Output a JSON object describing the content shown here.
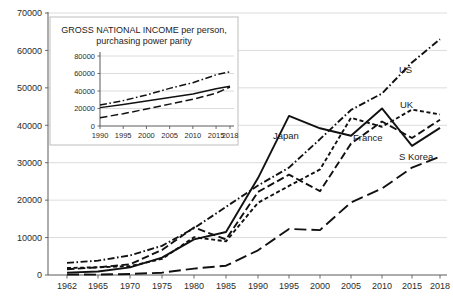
{
  "chart_data": {
    "type": "line",
    "title": "",
    "xlabel": "",
    "ylabel": "",
    "grid": true,
    "legend_position": "inline-end-of-line",
    "xlim": [
      1962,
      2018
    ],
    "ylim": [
      0,
      70000
    ],
    "x": [
      1962,
      1965,
      1970,
      1975,
      1980,
      1985,
      1990,
      1995,
      2000,
      2005,
      2010,
      2015,
      2018
    ],
    "xtick_labels": [
      "1962",
      "1965",
      "1970",
      "1975",
      "1980",
      "1985",
      "1990",
      "1995",
      "2000",
      "2005",
      "2010",
      "2015",
      "2018"
    ],
    "ytick_labels": [
      "0",
      "10000",
      "20000",
      "30000",
      "40000",
      "50000",
      "60000",
      "70000"
    ],
    "ytick_values": [
      0,
      10000,
      20000,
      30000,
      40000,
      50000,
      60000,
      70000
    ],
    "series": [
      {
        "name": "Japan",
        "label": "Japan",
        "style": "solid",
        "values": [
          630,
          920,
          2040,
          4660,
          9500,
          11500,
          25900,
          42500,
          39200,
          37200,
          44500,
          34500,
          39300
        ]
      },
      {
        "name": "US",
        "label": "US",
        "style": "dash-dot",
        "values": [
          3240,
          3830,
          5230,
          7800,
          12500,
          18200,
          23900,
          28700,
          36300,
          44100,
          48500,
          56800,
          63000
        ]
      },
      {
        "name": "UK",
        "label": "UK",
        "style": "short-dash",
        "values": [
          1870,
          2060,
          2360,
          4300,
          10100,
          9000,
          19300,
          23800,
          28200,
          42000,
          39600,
          44200,
          42900
        ]
      },
      {
        "name": "France",
        "label": "France",
        "style": "medium-dash",
        "values": [
          1530,
          2050,
          2860,
          6690,
          12700,
          9500,
          22200,
          26800,
          22400,
          35100,
          41000,
          36600,
          41500
        ]
      },
      {
        "name": "S Korea",
        "label": "S Korea",
        "style": "long-dash",
        "values": [
          120,
          110,
          280,
          620,
          1710,
          2480,
          6600,
          12300,
          12000,
          19400,
          23100,
          28700,
          31600
        ]
      }
    ],
    "inset": {
      "title_line1": "GROSS  NATIONAL INCOME per person,",
      "title_line2": "purchasing power parity",
      "type": "line",
      "xlim": [
        1990,
        2018
      ],
      "ylim": [
        0,
        80000
      ],
      "grid": true,
      "x": [
        1990,
        1995,
        2000,
        2005,
        2010,
        2015,
        2018
      ],
      "xtick_labels": [
        "1990",
        "1995",
        "2000",
        "2005",
        "2010",
        "2015",
        "2018"
      ],
      "ytick_labels": [
        "0",
        "20000",
        "40000",
        "60000",
        "80000"
      ],
      "ytick_values": [
        0,
        20000,
        40000,
        60000,
        80000
      ],
      "series": [
        {
          "name": "upper",
          "style": "dash-dot",
          "values": [
            24000,
            29000,
            35500,
            43000,
            49500,
            58500,
            62000
          ]
        },
        {
          "name": "middle",
          "style": "solid",
          "values": [
            21000,
            24500,
            28500,
            32500,
            36500,
            42500,
            45500
          ]
        },
        {
          "name": "lower",
          "style": "medium-dash",
          "values": [
            9500,
            14000,
            19500,
            25000,
            30500,
            37500,
            44500
          ]
        }
      ]
    }
  }
}
